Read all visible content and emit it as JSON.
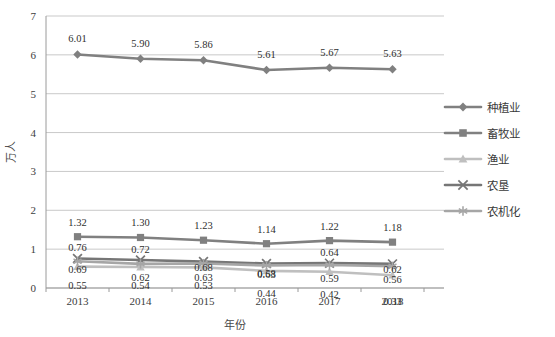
{
  "chart_data": {
    "type": "line",
    "title": "",
    "xlabel": "年份",
    "ylabel": "万人",
    "categories": [
      "2013",
      "2014",
      "2015",
      "2016",
      "2017",
      "2018"
    ],
    "ylim": [
      0,
      7
    ],
    "yticks": [
      "0",
      "1",
      "2",
      "3",
      "4",
      "5",
      "6",
      "7"
    ],
    "grid": true,
    "legend_position": "right",
    "series": [
      {
        "name": "种植业",
        "marker": "diamond",
        "color": "#808080",
        "values": [
          6.01,
          5.9,
          5.86,
          5.61,
          5.67,
          5.63
        ],
        "labels": [
          "6.01",
          "5.90",
          "5.86",
          "5.61",
          "5.67",
          "5.63"
        ]
      },
      {
        "name": "畜牧业",
        "marker": "square",
        "color": "#808080",
        "values": [
          1.32,
          1.3,
          1.23,
          1.14,
          1.22,
          1.18
        ],
        "labels": [
          "1.32",
          "1.30",
          "1.23",
          "1.14",
          "1.22",
          "1.18"
        ]
      },
      {
        "name": "渔业",
        "marker": "triangle",
        "color": "#bfbfbf",
        "values": [
          0.55,
          0.54,
          0.53,
          0.44,
          0.42,
          0.33
        ],
        "labels": [
          "0.55",
          "0.54",
          "0.53",
          "0.44",
          "0.42",
          "0.33"
        ]
      },
      {
        "name": "农垦",
        "marker": "x",
        "color": "#767676",
        "values": [
          0.76,
          0.72,
          0.68,
          0.63,
          0.64,
          0.62
        ],
        "labels": [
          "0.76",
          "0.72",
          "0.68",
          "0.63",
          "0.64",
          "0.62"
        ]
      },
      {
        "name": "农机化",
        "marker": "asterisk",
        "color": "#a6a6a6",
        "values": [
          0.69,
          0.62,
          0.63,
          0.58,
          0.59,
          0.56
        ],
        "labels": [
          "0.69",
          "0.62",
          "0.63",
          "0.58",
          "0.59",
          "0.56"
        ]
      }
    ]
  },
  "colors": {
    "gridline": "#c9c9c9",
    "axis": "#9a9a9a",
    "frame": "#bdbdbd",
    "text": "#333333",
    "background": "#ffffff"
  }
}
